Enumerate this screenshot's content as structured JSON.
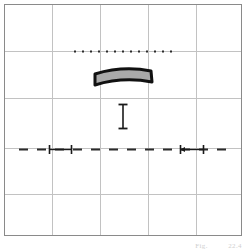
{
  "figure": {
    "caption": "Fig.",
    "caption_number": "22.4",
    "background_color": "#ffffff",
    "frame": {
      "border_color": "#8a8a8a",
      "x": 4,
      "y": 4,
      "width": 238,
      "height": 232
    },
    "grid": {
      "color": "#c2c2c2",
      "columns": 5,
      "rows": 5,
      "vertical_positions": [
        47,
        95,
        143,
        191
      ],
      "horizontal_positions": [
        46,
        93,
        143,
        189
      ]
    },
    "elements": [
      {
        "name": "dotted-reference-line",
        "type": "dotted-horizontal-line",
        "color": "#2b2b2b",
        "y": 46,
        "x_start": 69,
        "x_end": 167,
        "dot_size": 2,
        "dot_gap": 6
      },
      {
        "name": "curved-bar",
        "type": "arched-bar",
        "fill_color": "#a9a9a9",
        "stroke_color": "#111111",
        "stroke_width": 3,
        "x_left": 89,
        "x_right": 147,
        "y_top": 62,
        "y_bottom": 77,
        "arch_rise": 6
      },
      {
        "name": "vertical-dimension-marker",
        "type": "i-beam-marker",
        "color": "#1a1a1a",
        "x": 118,
        "y_top": 99,
        "y_bottom": 124,
        "cap_width": 9
      },
      {
        "name": "dashed-centerline",
        "type": "dashed-horizontal-line",
        "color": "#2b2b2b",
        "y": 144,
        "x_start": 14,
        "x_end": 226,
        "dash_length": 9,
        "dash_gap": 9
      },
      {
        "name": "left-dimension-span",
        "type": "dimension-arrow-span",
        "color": "#1a1a1a",
        "y": 144,
        "x_start": 44,
        "x_end": 67,
        "tick_height": 9
      },
      {
        "name": "right-dimension-span",
        "type": "dimension-arrow-span",
        "color": "#1a1a1a",
        "y": 144,
        "x_start": 175,
        "x_end": 199,
        "tick_height": 9
      }
    ]
  }
}
